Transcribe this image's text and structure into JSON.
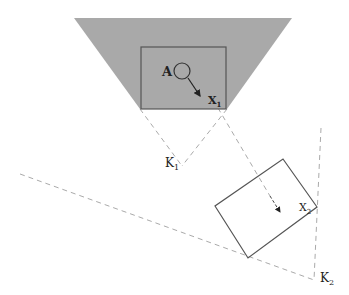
{
  "diagram": {
    "colors": {
      "field_fill": "#a9a9a9",
      "stroke": "#555555",
      "dash": "#aaaaaa",
      "text": "#222222",
      "background": "#ffffff"
    },
    "labels": {
      "object": "A",
      "x1_main": "X",
      "x1_sub": "1",
      "k1_main": "K",
      "k1_sub": "1",
      "x2_main": "X",
      "x2_sub": "2",
      "k2_main": "K",
      "k2_sub": "2"
    },
    "shapes": {
      "view_field_1": [
        [
          74,
          18
        ],
        [
          292,
          18
        ],
        [
          227,
          109
        ],
        [
          140,
          109
        ]
      ],
      "frame_1": {
        "x": 141,
        "y": 47,
        "w": 85,
        "h": 62
      },
      "object_circle": {
        "cx": 182,
        "cy": 71,
        "r": 8
      },
      "motion_arrow_1": {
        "x1": 188,
        "y1": 78,
        "x2": 201,
        "y2": 97
      },
      "camera_1": [
        182,
        166
      ],
      "frame_2": [
        [
          283,
          159
        ],
        [
          317,
          207
        ],
        [
          248,
          258
        ],
        [
          215,
          206
        ]
      ],
      "motion_arrow_2": {
        "x1": 268,
        "y1": 192,
        "x2": 281,
        "y2": 213
      },
      "camera_2": [
        314,
        280
      ]
    }
  }
}
